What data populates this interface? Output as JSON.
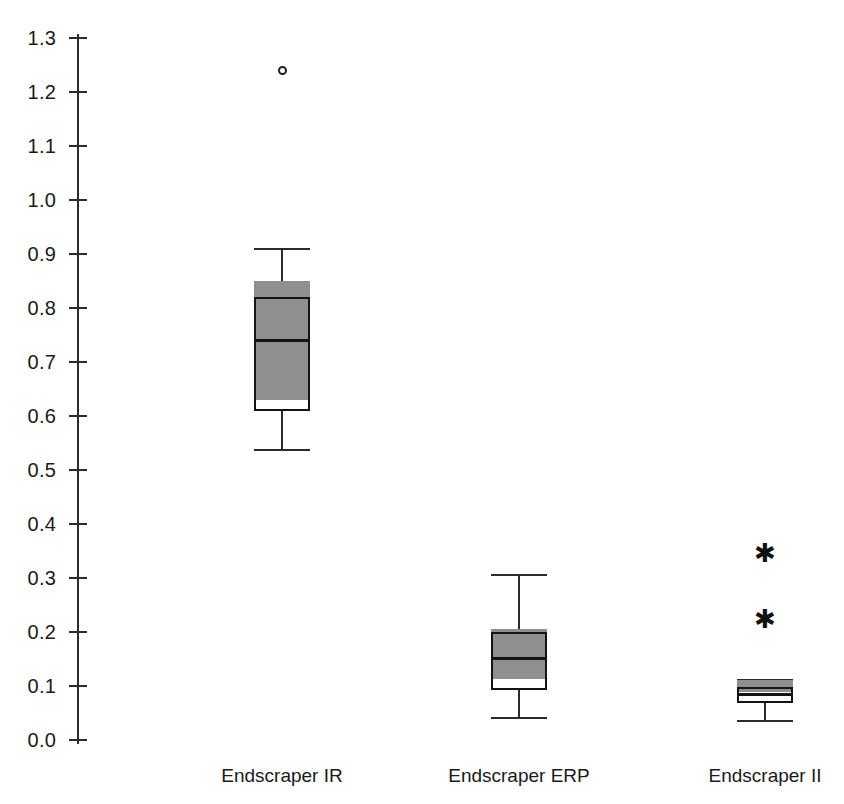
{
  "chart_data": {
    "type": "box",
    "title": "",
    "xlabel": "",
    "ylabel": "",
    "ylim": [
      0.0,
      1.3
    ],
    "grid": false,
    "legend": null,
    "y_ticks": [
      "1.3",
      "1.2",
      "1.1",
      "1.0",
      "0.9",
      "0.8",
      "0.7",
      "0.6",
      "0.5",
      "0.4",
      "0.3",
      "0.2",
      "0.1",
      "0.0"
    ],
    "y_tick_values": [
      1.3,
      1.2,
      1.1,
      1.0,
      0.9,
      0.8,
      0.7,
      0.6,
      0.5,
      0.4,
      0.3,
      0.2,
      0.1,
      0.0
    ],
    "categories": [
      "Endscraper IR",
      "Endscraper ERP",
      "Endscraper II"
    ],
    "boxes": [
      {
        "category": "Endscraper IR",
        "whisker_low": 0.537,
        "q1": 0.61,
        "median": 0.74,
        "q3": 0.82,
        "upper_shade": 0.85,
        "whisker_high": 0.91,
        "outliers": [
          1.24
        ],
        "extremes": []
      },
      {
        "category": "Endscraper ERP",
        "whisker_low": 0.04,
        "q1": 0.093,
        "median": 0.152,
        "q3": 0.2,
        "upper_shade": 0.205,
        "whisker_high": 0.305,
        "outliers": [],
        "extremes": []
      },
      {
        "category": "Endscraper II",
        "whisker_low": 0.035,
        "q1": 0.068,
        "median": 0.085,
        "q3": 0.098,
        "upper_shade": 0.112,
        "whisker_high": 0.112,
        "outliers": [],
        "extremes": [
          0.345,
          0.222
        ]
      }
    ],
    "colors": {
      "box_fill": "#8f8f8f",
      "box_outline": "#141414",
      "axis": "#2b2b2b",
      "text": "#1a1a1a",
      "background": "#ffffff"
    },
    "markers": {
      "outlier": "open-circle",
      "extreme": "asterisk"
    }
  }
}
